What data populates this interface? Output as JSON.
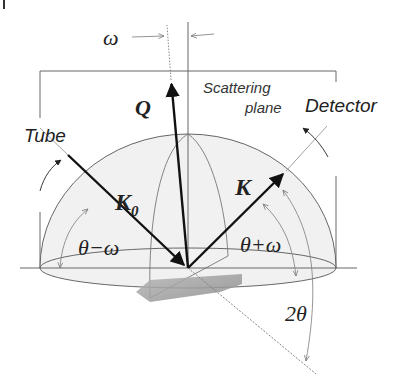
{
  "diagram": {
    "type": "x-ray diffraction geometry (hemisphere)",
    "labels": {
      "omega_top": "ω",
      "Q": "Q",
      "scattering_plane_line1": "Scattering",
      "scattering_plane_line2": "plane",
      "detector": "Detector",
      "tube": "Tube",
      "K0_main": "K",
      "K0_sub": "0",
      "K": "K",
      "theta_minus_omega": "θ−ω",
      "theta_plus_omega": "θ+ω",
      "two_theta": "2θ"
    },
    "vectors": [
      {
        "name": "K0",
        "from": "Tube",
        "to": "sample",
        "description": "incident wave vector"
      },
      {
        "name": "K",
        "from": "sample",
        "to": "Detector",
        "description": "diffracted wave vector"
      },
      {
        "name": "Q",
        "from": "sample",
        "to": "up, tilted by ω",
        "description": "scattering vector"
      }
    ],
    "angles": [
      "ω",
      "θ−ω",
      "θ+ω",
      "2θ"
    ],
    "colors": {
      "line": "#555555",
      "arrow": "#111111",
      "hemisphere_fill": "#f1f1f1",
      "sample": "#9a9a9a",
      "text": "#222222"
    }
  }
}
